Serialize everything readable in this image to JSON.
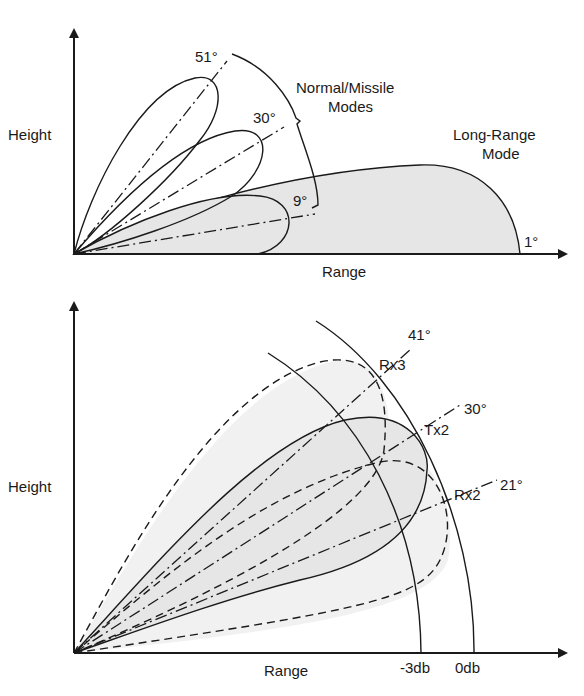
{
  "top_diagram": {
    "axis_labels": {
      "y": "Height",
      "x": "Range"
    },
    "mode_labels": {
      "normal_line1": "Normal/Missile",
      "normal_line2": "Modes",
      "longrange_line1": "Long-Range",
      "longrange_line2": "Mode"
    },
    "beams": [
      {
        "angle_label": "51°",
        "mode": "Normal/Missile"
      },
      {
        "angle_label": "30°",
        "mode": "Normal/Missile"
      },
      {
        "angle_label": "9°",
        "mode": "Normal/Missile"
      },
      {
        "angle_label": "1°",
        "mode": "Long-Range"
      }
    ]
  },
  "bottom_diagram": {
    "axis_labels": {
      "y": "Height",
      "x": "Range"
    },
    "range_arcs": [
      {
        "label": "-3db"
      },
      {
        "label": "0db"
      }
    ],
    "beams": [
      {
        "name": "Rx3",
        "angle_label": "41°",
        "style": "dashed"
      },
      {
        "name": "Tx2",
        "angle_label": "30°",
        "style": "solid"
      },
      {
        "name": "Rx2",
        "angle_label": "21°",
        "style": "dashed"
      }
    ]
  },
  "colors": {
    "line": "#1a1a1a",
    "shade": "#e6e6e6",
    "background": "#ffffff"
  }
}
